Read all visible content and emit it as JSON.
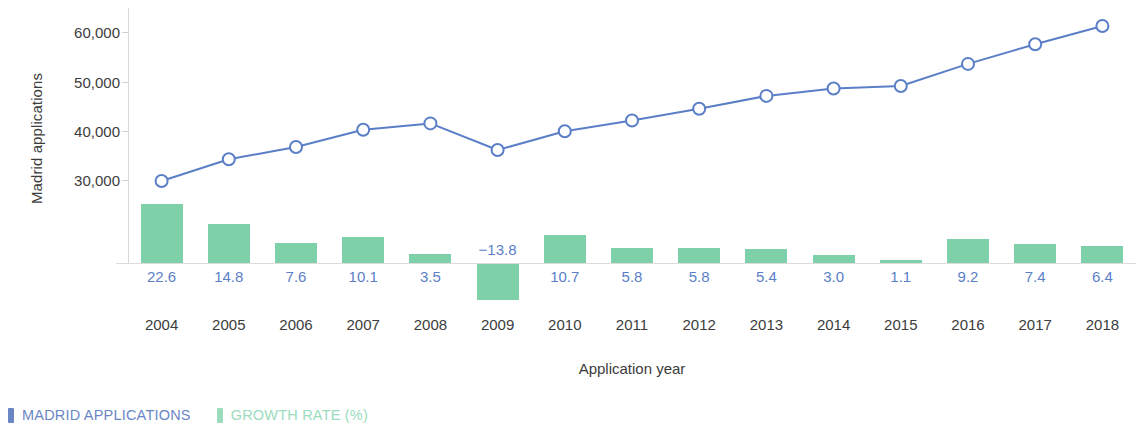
{
  "chart_data": {
    "type": "line",
    "title": "",
    "xlabel": "Application year",
    "ylabel": "Madrid applications",
    "categories": [
      "2004",
      "2005",
      "2006",
      "2007",
      "2008",
      "2009",
      "2010",
      "2011",
      "2012",
      "2013",
      "2014",
      "2015",
      "2016",
      "2017",
      "2018"
    ],
    "ylim": [
      0,
      65000
    ],
    "yticks": [
      30000,
      40000,
      50000,
      60000
    ],
    "ytick_labels": [
      "30,000",
      "40,000",
      "50,000",
      "60,000"
    ],
    "grid": false,
    "legend_position": "bottom-left",
    "series": [
      {
        "name": "MADRID APPLICATIONS",
        "type": "line",
        "color": "#5b7fc7",
        "marker": "open-circle",
        "axis": "left",
        "values": [
          29800,
          34200,
          36700,
          40200,
          41500,
          36100,
          39900,
          42100,
          44500,
          47100,
          48600,
          49100,
          53600,
          57600,
          61300
        ]
      },
      {
        "name": "GROWTH RATE (%)",
        "type": "bar",
        "color": "#7ed0a9",
        "axis": "right",
        "values": [
          22.6,
          14.8,
          7.6,
          10.1,
          3.5,
          -13.8,
          10.7,
          5.8,
          5.8,
          5.4,
          3.0,
          1.1,
          9.2,
          7.4,
          6.4
        ],
        "value_labels": [
          "22.6",
          "14.8",
          "7.6",
          "10.1",
          "3.5",
          "−13.8",
          "10.7",
          "5.8",
          "5.8",
          "5.4",
          "3.0",
          "1.1",
          "9.2",
          "7.4",
          "6.4"
        ]
      }
    ]
  },
  "axes": {
    "y_title": "Madrid applications",
    "x_title": "Application year",
    "y_tick_labels": [
      "60,000",
      "50,000",
      "40,000",
      "30,000"
    ],
    "x_tick_labels": [
      "2004",
      "2005",
      "2006",
      "2007",
      "2008",
      "2009",
      "2010",
      "2011",
      "2012",
      "2013",
      "2014",
      "2015",
      "2016",
      "2017",
      "2018"
    ]
  },
  "legend": {
    "items": [
      {
        "label": "MADRID APPLICATIONS",
        "color": "#6b86c4"
      },
      {
        "label": "GROWTH RATE (%)",
        "color": "#9bdcbd"
      }
    ]
  },
  "colors": {
    "line": "#5b7fc7",
    "marker_fill": "#ffffff",
    "bar": "#7ed0a9",
    "value_label": "#5b7fc7",
    "axis_text": "#3c3c3c",
    "axis_line": "#d8d8d8"
  }
}
